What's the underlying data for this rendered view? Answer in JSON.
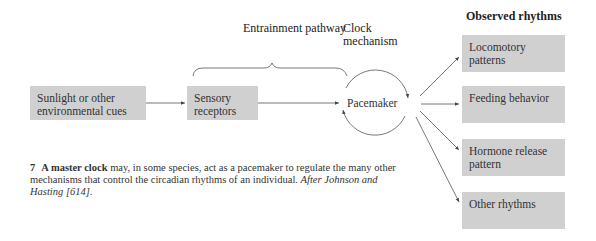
{
  "diagram": {
    "input_box": {
      "label": "Sunlight or other environmental cues"
    },
    "receptor_box": {
      "label": "Sensory receptors"
    },
    "entrainment_label": "Entrainment pathway",
    "clock_label": "Clock mechanism",
    "pacemaker_label": "Pacemaker",
    "outputs_header": "Observed rhythms",
    "outputs": [
      {
        "label": "Locomotory patterns"
      },
      {
        "label": "Feeding behavior"
      },
      {
        "label": "Hormone release pattern"
      },
      {
        "label": "Other rhythms"
      }
    ],
    "colors": {
      "box_fill": "#d0d0d0",
      "line": "#444444"
    }
  },
  "caption": {
    "figure_number": "7",
    "lead": "A master clock",
    "body": " may, in some species, act as a pacemaker to regulate the many other mechanisms that control the circadian rhythms of an individual. ",
    "citation": "After Johnson and Hasting [614]",
    "end": "."
  }
}
